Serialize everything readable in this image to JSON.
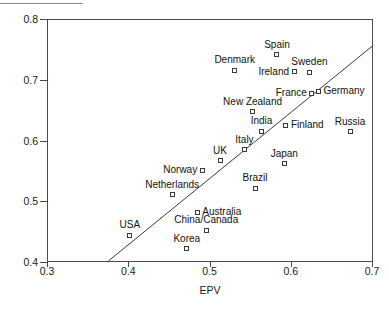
{
  "chart_data": {
    "type": "scatter",
    "title": "",
    "xlabel": "EPV",
    "ylabel": "VoU",
    "xlim": [
      0.3,
      0.7
    ],
    "ylim": [
      0.4,
      0.8
    ],
    "xticks": [
      "0.3",
      "0.4",
      "0.5",
      "0.6",
      "0.7"
    ],
    "yticks": [
      "0.4",
      "0.5",
      "0.6",
      "0.7",
      "0.8"
    ],
    "xtick_values": [
      0.3,
      0.4,
      0.5,
      0.6,
      0.7
    ],
    "ytick_values": [
      0.4,
      0.5,
      0.6,
      0.7,
      0.8
    ],
    "grid": false,
    "legend": "none",
    "points": [
      {
        "label": "Spain",
        "x": 0.583,
        "y": 0.741,
        "label_pos": "above"
      },
      {
        "label": "Denmark",
        "x": 0.531,
        "y": 0.716,
        "label_pos": "above"
      },
      {
        "label": "Ireland",
        "x": 0.604,
        "y": 0.713,
        "label_pos": "left"
      },
      {
        "label": "Sweden",
        "x": 0.623,
        "y": 0.712,
        "label_pos": "above"
      },
      {
        "label": "Germany",
        "x": 0.634,
        "y": 0.681,
        "label_pos": "right"
      },
      {
        "label": "France",
        "x": 0.626,
        "y": 0.678,
        "label_pos": "left"
      },
      {
        "label": "New Zealand",
        "x": 0.553,
        "y": 0.647,
        "label_pos": "above"
      },
      {
        "label": "Russia",
        "x": 0.673,
        "y": 0.614,
        "label_pos": "above"
      },
      {
        "label": "Finland",
        "x": 0.594,
        "y": 0.625,
        "label_pos": "right"
      },
      {
        "label": "India",
        "x": 0.564,
        "y": 0.615,
        "label_pos": "above"
      },
      {
        "label": "Italy",
        "x": 0.543,
        "y": 0.585,
        "label_pos": "above"
      },
      {
        "label": "UK",
        "x": 0.513,
        "y": 0.567,
        "label_pos": "above"
      },
      {
        "label": "Japan",
        "x": 0.592,
        "y": 0.562,
        "label_pos": "above"
      },
      {
        "label": "Norway",
        "x": 0.491,
        "y": 0.551,
        "label_pos": "left"
      },
      {
        "label": "Netherlands",
        "x": 0.454,
        "y": 0.511,
        "label_pos": "above"
      },
      {
        "label": "Brazil",
        "x": 0.556,
        "y": 0.521,
        "label_pos": "above"
      },
      {
        "label": "Australia",
        "x": 0.485,
        "y": 0.482,
        "label_pos": "right"
      },
      {
        "label": "China/Canada",
        "x": 0.496,
        "y": 0.452,
        "label_pos": "above"
      },
      {
        "label": "USA",
        "x": 0.402,
        "y": 0.444,
        "label_pos": "above"
      },
      {
        "label": "Korea",
        "x": 0.472,
        "y": 0.422,
        "label_pos": "above"
      }
    ],
    "fit_line": {
      "type": "linear-trend",
      "x_start": 0.374,
      "y_start": 0.4,
      "x_end": 0.7,
      "y_end": 0.755
    }
  }
}
